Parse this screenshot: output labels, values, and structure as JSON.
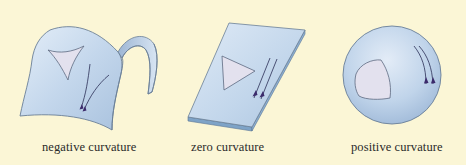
{
  "figure": {
    "background_color": "#fbf6d6",
    "surface_color": "#c6d9ee",
    "surface_edge_color": "#6a7f97",
    "triangle_fill": "#e3e1ee",
    "geodesic_color": "#2b2f55",
    "arrow_color": "#3b2a6b"
  },
  "panels": [
    {
      "id": "negative",
      "shape": "saddle",
      "label": "negative curvature",
      "triangle_type": "concave-sided triangle",
      "geodesics": "diverging"
    },
    {
      "id": "zero",
      "shape": "flat-plane",
      "label": "zero curvature",
      "triangle_type": "straight-sided triangle",
      "geodesics": "parallel"
    },
    {
      "id": "positive",
      "shape": "sphere",
      "label": "positive curvature",
      "triangle_type": "convex-sided triangle",
      "geodesics": "converging"
    }
  ]
}
